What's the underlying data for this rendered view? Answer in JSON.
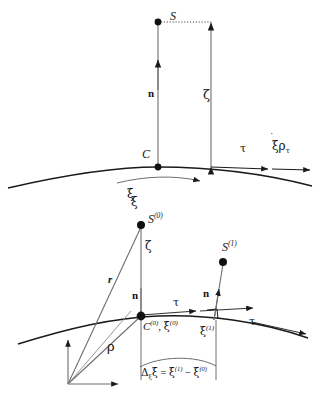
{
  "figure": {
    "stroke_color": "#1a1a1a",
    "background": "#ffffff",
    "panels": [
      {
        "name": "upper-panel",
        "description": "Single point S above curved surface at point C"
      },
      {
        "name": "lower-panel",
        "description": "Two points S(0) and S(1) above curved surface with position vectors"
      }
    ]
  },
  "upper": {
    "point_s_label": "S",
    "point_c_label": "C",
    "normal_label": "n",
    "height_label": "ζ",
    "tangent_label": "τ",
    "velocity_label": "ξ",
    "velocity_rho": "ρ",
    "velocity_rho_sub": "τ",
    "arc_label": "ξ"
  },
  "lower": {
    "point_s0_base": "S",
    "point_s0_sup": "(0)",
    "point_s1_base": "S",
    "point_s1_sup": "(1)",
    "point_c0_base": "C",
    "point_c0_sup": "(0)",
    "comma": ",",
    "xi0_base": "ξ",
    "xi0_sup": "(0)",
    "xi1_base": "ξ",
    "xi1_sup": "(1)",
    "zeta_label": "ζ",
    "normal_label_left": "n",
    "normal_label_right": "n",
    "tangent_label_left": "τ",
    "tangent_label_right": "τ",
    "vector_r_label": "r",
    "vector_rho_label": "ρ",
    "arc_top_label": "ξ",
    "equation": {
      "delta": "Δ",
      "delta_sub": "ξ",
      "lhs_tail": "ξ",
      "equals": "=",
      "term1_base": "ξ",
      "term1_sup": "(1)",
      "minus": "−",
      "term2_base": "ξ",
      "term2_sup": "(0)"
    }
  }
}
